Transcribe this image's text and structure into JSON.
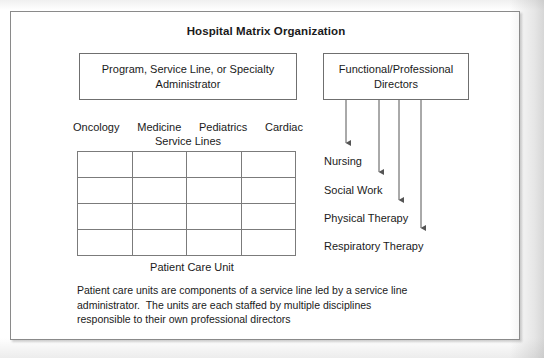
{
  "figure": {
    "title": "Hospital Matrix Organization",
    "admin_box": {
      "line1": "Program, Service Line, or Specialty",
      "line2": "Administrator"
    },
    "directors_box": {
      "line1": "Functional/Professional",
      "line2": "Directors"
    },
    "service_lines": {
      "headers": [
        "Oncology",
        "Medicine",
        "Pediatrics",
        "Cardiac"
      ],
      "group_label": "Service Lines"
    },
    "grid": {
      "columns": 4,
      "rows": 4
    },
    "unit_label": "Patient Care Unit",
    "disciplines": [
      {
        "label": "Nursing"
      },
      {
        "label": "Social Work"
      },
      {
        "label": "Physical Therapy"
      },
      {
        "label": "Respiratory Therapy"
      }
    ],
    "caption": {
      "line1": "Patient care units are components of a service line led by a service line",
      "line2": "administrator.  The units are each staffed by multiple disciplines",
      "line3": "responsible to their own professional directors"
    },
    "colors": {
      "page_background": "#ffffff",
      "frame_border": "#8a8a8a",
      "box_border": "#6f6f6f",
      "grid_line": "#7b7b7b",
      "text": "#1a1a1a",
      "arrow": "#555555"
    }
  }
}
